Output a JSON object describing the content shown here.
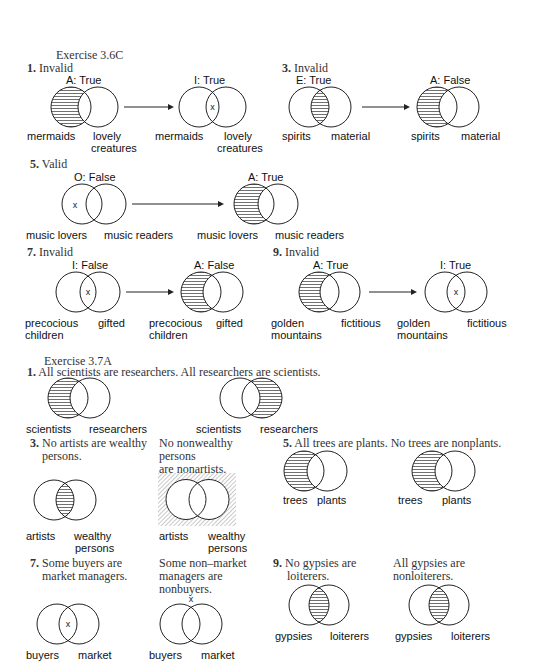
{
  "ex36c": {
    "heading": "Exercise 3.6C",
    "items": [
      {
        "num": "1.",
        "verdict": "Invalid",
        "left": {
          "caption": "A: True",
          "shade": "left",
          "x": null,
          "labels": [
            "mermaids",
            "lovely\ncreatures"
          ]
        },
        "right": {
          "caption": "I: True",
          "shade": "none",
          "x": "middle",
          "labels": [
            "mermaids",
            "lovely\ncreatures"
          ]
        }
      },
      {
        "num": "3.",
        "verdict": "Invalid",
        "left": {
          "caption": "E: True",
          "shade": "middle",
          "x": null,
          "labels": [
            "spirits",
            "material"
          ]
        },
        "right": {
          "caption": "A: False",
          "shade": "left",
          "x": null,
          "labels": [
            "spirits",
            "material"
          ]
        }
      },
      {
        "num": "5.",
        "verdict": "Valid",
        "left": {
          "caption": "O: False",
          "shade": "none",
          "x": "left",
          "labels": [
            "music lovers",
            "music readers"
          ]
        },
        "right": {
          "caption": "A: True",
          "shade": "left",
          "x": null,
          "labels": [
            "music lovers",
            "music readers"
          ]
        }
      },
      {
        "num": "7.",
        "verdict": "Invalid",
        "left": {
          "caption": "I: False",
          "shade": "none",
          "x": "middle",
          "labels": [
            "precocious\nchildren",
            "gifted"
          ]
        },
        "right": {
          "caption": "A: False",
          "shade": "left",
          "x": null,
          "labels": [
            "precocious\nchildren",
            "gifted"
          ]
        }
      },
      {
        "num": "9.",
        "verdict": "Invalid",
        "left": {
          "caption": "A: True",
          "shade": "left",
          "x": null,
          "labels": [
            "golden\nmountains",
            "fictitious"
          ]
        },
        "right": {
          "caption": "I: True",
          "shade": "none",
          "x": "middle",
          "labels": [
            "golden\nmountains",
            "fictitious"
          ]
        }
      }
    ]
  },
  "ex37a": {
    "heading": "Exercise 3.7A",
    "items": [
      {
        "num": "1.",
        "statement": "All scientists are researchers. All researchers are scientists.",
        "left": {
          "shade": "left",
          "labels": [
            "scientists",
            "researchers"
          ]
        },
        "right": {
          "shade": "right",
          "labels": [
            "scientists",
            "researchers"
          ]
        }
      },
      {
        "num": "3.",
        "statement_left": "No artists are wealthy persons.",
        "statement_right": "No nonwealthy persons are nonartists.",
        "left": {
          "shade": "middle",
          "labels": [
            "artists",
            "wealthy\npersons"
          ]
        },
        "right": {
          "shade": "outside",
          "labels": [
            "artists",
            "wealthy\npersons"
          ]
        }
      },
      {
        "num": "5.",
        "statement": "All trees are plants. No trees are nonplants.",
        "left": {
          "shade": "left",
          "labels": [
            "trees",
            "plants"
          ]
        },
        "right": {
          "shade": "left",
          "labels": [
            "trees",
            "plants"
          ]
        }
      },
      {
        "num": "7.",
        "statement_left": "Some buyers are market managers.",
        "statement_right": "Some non–market managers are nonbuyers.",
        "left": {
          "shade": "none",
          "x": "middle",
          "labels": [
            "buyers",
            "market"
          ]
        },
        "right": {
          "shade": "none",
          "x": "outside",
          "labels": [
            "buyers",
            "market"
          ]
        }
      },
      {
        "num": "9.",
        "statement_left": "No gypsies are loiterers.",
        "statement_right": "All gypsies are nonloiterers.",
        "left": {
          "shade": "middle",
          "labels": [
            "gypsies",
            "loiterers"
          ]
        },
        "right": {
          "shade": "middle",
          "labels": [
            "gypsies",
            "loiterers"
          ]
        }
      }
    ]
  },
  "text": {
    "h1": "Exercise 3.6C",
    "n1": "1.",
    "v1": "Invalid",
    "n3": "3.",
    "v3": "Invalid",
    "n5": "5.",
    "v5": "Valid",
    "n7": "7.",
    "v7": "Invalid",
    "n9": "9.",
    "v9": "Invalid",
    "c1l": "A: True",
    "c1r": "I: True",
    "c3l": "E: True",
    "c3r": "A: False",
    "c5l": "O: False",
    "c5r": "A: True",
    "c7l": "I: False",
    "c7r": "A: False",
    "c9l": "A: True",
    "c9r": "I: True",
    "mermaids": "mermaids",
    "lovely": "lovely",
    "creatures": "creatures",
    "spirits": "spirits",
    "material": "material",
    "music_lovers": "music lovers",
    "music_readers": "music readers",
    "precocious": "precocious",
    "children": "children",
    "gifted": "gifted",
    "golden": "golden",
    "mountains": "mountains",
    "fictitious": "fictitious",
    "h2": "Exercise 3.7A",
    "s1": "All scientists are researchers. All researchers are scientists.",
    "scientists": "scientists",
    "researchers": "researchers",
    "s3a_1": "No artists are wealthy",
    "s3a_2": "persons.",
    "s3b_1": "No nonwealthy",
    "s3b_2": "persons",
    "s3b_3": "are nonartists.",
    "s5": "All trees are plants. No trees are nonplants.",
    "trees": "trees",
    "plants": "plants",
    "artists": "artists",
    "wealthy": "wealthy",
    "persons": "persons",
    "s7a_1": "Some buyers are",
    "s7a_2": "market managers.",
    "s7b_1": "Some non–market",
    "s7b_2": "managers are",
    "s7b_3": "nonbuyers.",
    "s9a_1": "No gypsies are",
    "s9a_2": "loiterers.",
    "s9b_1": "All gypsies are",
    "s9b_2": "nonloiterers.",
    "gypsies": "gypsies",
    "loiterers": "loiterers",
    "buyers": "buyers",
    "market": "market",
    "x_mark": "x"
  }
}
